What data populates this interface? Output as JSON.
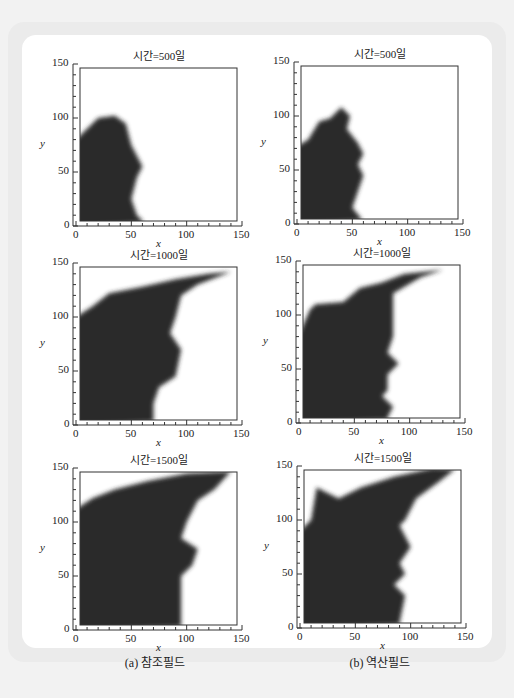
{
  "figure": {
    "panels": [
      {
        "id": "a",
        "caption": "(a) 참조필드"
      },
      {
        "id": "b",
        "caption": "(b) 역산필드"
      }
    ],
    "plots": [
      {
        "title": "시간=500일",
        "column": "a",
        "row": 0
      },
      {
        "title": "시간=500일",
        "column": "b",
        "row": 0
      },
      {
        "title": "시간=1000일",
        "column": "a",
        "row": 1
      },
      {
        "title": "시간=1000일",
        "column": "b",
        "row": 1
      },
      {
        "title": "시간=1500일",
        "column": "a",
        "row": 2
      },
      {
        "title": "시간=1500일",
        "column": "b",
        "row": 2
      }
    ],
    "axes": {
      "xlabel": "x",
      "ylabel": "y",
      "xticks": [
        "0",
        "50",
        "100",
        "150"
      ],
      "yticks": [
        "0",
        "50",
        "100",
        "150"
      ]
    }
  },
  "chart_data": [
    {
      "type": "heatmap",
      "title": "시간=500일",
      "panel": "(a) 참조필드",
      "xlabel": "x",
      "ylabel": "y",
      "xlim": [
        0,
        150
      ],
      "ylim": [
        0,
        150
      ],
      "description": "dark region (high saturation) occupying left side; front boundary approx",
      "front": [
        [
          0,
          80
        ],
        [
          10,
          90
        ],
        [
          20,
          100
        ],
        [
          35,
          102
        ],
        [
          45,
          95
        ],
        [
          50,
          75
        ],
        [
          55,
          65
        ],
        [
          60,
          55
        ],
        [
          55,
          45
        ],
        [
          50,
          25
        ],
        [
          55,
          10
        ],
        [
          60,
          5
        ]
      ]
    },
    {
      "type": "heatmap",
      "title": "시간=500일",
      "panel": "(b) 역산필드",
      "xlabel": "x",
      "ylabel": "y",
      "xlim": [
        0,
        150
      ],
      "ylim": [
        0,
        150
      ],
      "front": [
        [
          0,
          72
        ],
        [
          10,
          78
        ],
        [
          20,
          95
        ],
        [
          30,
          98
        ],
        [
          40,
          108
        ],
        [
          48,
          100
        ],
        [
          45,
          88
        ],
        [
          55,
          75
        ],
        [
          60,
          65
        ],
        [
          55,
          55
        ],
        [
          60,
          45
        ],
        [
          55,
          30
        ],
        [
          50,
          15
        ],
        [
          58,
          5
        ]
      ]
    },
    {
      "type": "heatmap",
      "title": "시간=1000일",
      "panel": "(a) 참조필드",
      "xlabel": "x",
      "ylabel": "y",
      "xlim": [
        0,
        150
      ],
      "ylim": [
        0,
        150
      ],
      "front": [
        [
          0,
          100
        ],
        [
          15,
          110
        ],
        [
          30,
          122
        ],
        [
          60,
          128
        ],
        [
          90,
          135
        ],
        [
          120,
          140
        ],
        [
          140,
          142
        ],
        [
          110,
          130
        ],
        [
          95,
          120
        ],
        [
          90,
          100
        ],
        [
          85,
          85
        ],
        [
          95,
          70
        ],
        [
          90,
          45
        ],
        [
          75,
          35
        ],
        [
          70,
          20
        ],
        [
          70,
          5
        ]
      ]
    },
    {
      "type": "heatmap",
      "title": "시간=1000일",
      "panel": "(b) 역산필드",
      "xlabel": "x",
      "ylabel": "y",
      "xlim": [
        0,
        150
      ],
      "ylim": [
        0,
        150
      ],
      "front": [
        [
          0,
          82
        ],
        [
          10,
          105
        ],
        [
          15,
          110
        ],
        [
          40,
          112
        ],
        [
          55,
          125
        ],
        [
          75,
          130
        ],
        [
          95,
          138
        ],
        [
          130,
          142
        ],
        [
          110,
          135
        ],
        [
          85,
          120
        ],
        [
          85,
          80
        ],
        [
          80,
          65
        ],
        [
          90,
          55
        ],
        [
          80,
          45
        ],
        [
          80,
          30
        ],
        [
          75,
          25
        ],
        [
          85,
          15
        ],
        [
          80,
          5
        ]
      ]
    },
    {
      "type": "heatmap",
      "title": "시간=1500일",
      "panel": "(a) 참조필드",
      "xlabel": "x",
      "ylabel": "y",
      "xlim": [
        0,
        150
      ],
      "ylim": [
        0,
        150
      ],
      "front": [
        [
          0,
          112
        ],
        [
          15,
          122
        ],
        [
          35,
          130
        ],
        [
          65,
          138
        ],
        [
          100,
          145
        ],
        [
          140,
          147
        ],
        [
          125,
          130
        ],
        [
          110,
          120
        ],
        [
          100,
          100
        ],
        [
          95,
          85
        ],
        [
          110,
          75
        ],
        [
          105,
          60
        ],
        [
          95,
          50
        ],
        [
          95,
          20
        ],
        [
          95,
          5
        ]
      ]
    },
    {
      "type": "heatmap",
      "title": "시간=1500일",
      "panel": "(b) 역산필드",
      "xlabel": "x",
      "ylabel": "y",
      "xlim": [
        0,
        150
      ],
      "ylim": [
        0,
        150
      ],
      "front": [
        [
          0,
          90
        ],
        [
          10,
          100
        ],
        [
          15,
          130
        ],
        [
          25,
          125
        ],
        [
          35,
          120
        ],
        [
          55,
          130
        ],
        [
          85,
          140
        ],
        [
          120,
          148
        ],
        [
          140,
          147
        ],
        [
          125,
          135
        ],
        [
          105,
          120
        ],
        [
          95,
          100
        ],
        [
          90,
          95
        ],
        [
          100,
          75
        ],
        [
          90,
          60
        ],
        [
          95,
          50
        ],
        [
          85,
          40
        ],
        [
          95,
          30
        ],
        [
          90,
          5
        ]
      ]
    }
  ]
}
